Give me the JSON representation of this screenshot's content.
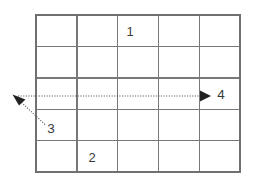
{
  "figure": {
    "background_color": "#ffffff",
    "width": 253,
    "height": 181
  },
  "grid": {
    "columns": 5,
    "rows": 5,
    "left": 36,
    "top": 15,
    "right": 240,
    "bottom": 172,
    "cell_width": 40.8,
    "cell_height": 31.4,
    "line_color": "#787878",
    "border_color": "#707070",
    "fill_color": "#ffffff"
  },
  "cell_labels": [
    {
      "name": "label-1",
      "text": "1",
      "column": 3,
      "row": 1,
      "x": 130,
      "y": 31
    },
    {
      "name": "label-2",
      "text": "2",
      "column": 2,
      "row": 5,
      "x": 92,
      "y": 157
    }
  ],
  "arrows": [
    {
      "name": "arrow-3",
      "label": "3",
      "style": "dotted",
      "direction": "up-left",
      "start_x": 45,
      "start_y": 124,
      "end_x": 14,
      "end_y": 95,
      "label_x": 51,
      "label_y": 129,
      "color": "#555555"
    },
    {
      "name": "arrow-4",
      "label": "4",
      "style": "dotted",
      "direction": "right",
      "start_x": 18,
      "start_y": 96,
      "end_x": 210,
      "end_y": 96,
      "label_x": 221,
      "label_y": 95,
      "color": "#555555"
    }
  ],
  "arrow_labels": [
    {
      "name": "arrow-label-3",
      "text": "3",
      "x": 51,
      "y": 129
    },
    {
      "name": "arrow-label-4",
      "text": "4",
      "x": 221,
      "y": 95
    }
  ]
}
